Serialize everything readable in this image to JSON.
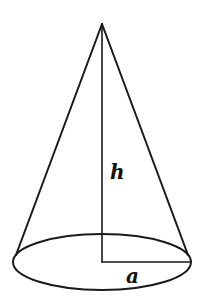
{
  "diagram": {
    "type": "right-circular-cone",
    "labels": {
      "height": "h",
      "radius": "a"
    },
    "geometry": {
      "apex": [
        102,
        24
      ],
      "base_center": [
        102,
        262
      ],
      "base_rx": 89,
      "base_ry": 28,
      "left_tangent": [
        15,
        255
      ],
      "right_tangent": [
        189,
        255
      ]
    },
    "colors": {
      "stroke": "#1a1a1a",
      "background": "#ffffff"
    }
  }
}
